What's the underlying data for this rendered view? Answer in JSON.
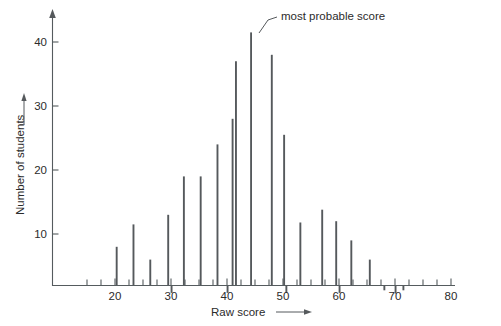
{
  "chart_data": {
    "type": "bar",
    "title": "",
    "xlabel": "Raw score",
    "ylabel": "Number of students",
    "xlim": [
      13,
      82
    ],
    "ylim": [
      0,
      44
    ],
    "grid": false,
    "legend": null,
    "x_tick_labels": [
      "20",
      "30",
      "40",
      "50",
      "60",
      "70",
      "80"
    ],
    "x_tick_values": [
      20,
      30,
      40,
      50,
      60,
      70,
      80
    ],
    "x_minor_tick_step": 2.5,
    "y_tick_labels": [
      "10",
      "20",
      "30",
      "40"
    ],
    "y_tick_values": [
      10,
      20,
      30,
      40
    ],
    "x": [
      20.3,
      23.3,
      26.3,
      29.5,
      30.1,
      32.3,
      35.3,
      38.3,
      40.1,
      41.0,
      41.6,
      44.3,
      48.0,
      50.2,
      50.6,
      53.1,
      57.0,
      59.5,
      60.1,
      62.2,
      65.5,
      68.1,
      70.1,
      71.5
    ],
    "values": [
      8.0,
      11.5,
      6.0,
      13.0,
      0.8,
      19.0,
      19.0,
      24.0,
      0.8,
      28.0,
      37.0,
      41.5,
      38.0,
      25.5,
      0.8,
      11.8,
      13.8,
      12.0,
      0.8,
      9.0,
      6.0,
      1.2,
      0.7,
      1.2
    ],
    "annotations": [
      {
        "text": "most probable score",
        "points_to_x": 44.3,
        "points_to_y": 41.5
      }
    ],
    "axis_arrows": [
      "x-axis-right",
      "y-axis-up"
    ]
  },
  "labels": {
    "y_axis_title": "Number of students",
    "x_axis_title": "Raw score",
    "annotation": "most probable score",
    "y_ticks": [
      "10",
      "20",
      "30",
      "40"
    ],
    "x_ticks": [
      "20",
      "30",
      "40",
      "50",
      "60",
      "70",
      "80"
    ]
  },
  "colors": {
    "bar": "#55595c",
    "axis": "#555b5e",
    "text": "#2b2b2b",
    "background": "#ffffff"
  }
}
